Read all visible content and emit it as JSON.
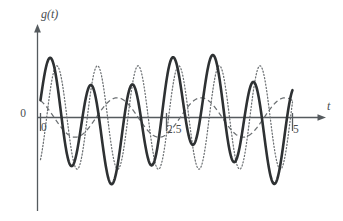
{
  "figure": {
    "background_color": "#ffffff",
    "ink_color": "#2e3133",
    "axis_color": "#555a5e",
    "secondary_color": "#6c7073"
  },
  "axes": {
    "y_axis_label": "g(t)",
    "x_axis_label": "t",
    "origin_label": "0",
    "x_tick_labels": [
      "0",
      "2.5",
      "5"
    ],
    "x_tick_values": [
      0,
      2.5,
      5
    ],
    "y_tick_labels": [],
    "has_arrow_heads": true,
    "grid": false
  },
  "chart_data": {
    "type": "line",
    "title": "",
    "subtitle": "",
    "xlabel": "t",
    "ylabel": "g(t)",
    "xlim": [
      0,
      5
    ],
    "ylim": [
      -1.45,
      1.45
    ],
    "grid": false,
    "legend": "none",
    "x_ticks": [
      0,
      2.5,
      5
    ],
    "x_tick_labels": [
      "0",
      "2.5",
      "5"
    ],
    "y_ticks": [],
    "annotations": [],
    "series": [
      {
        "name": "sum-wave",
        "style": "solid",
        "linewidth": 2.6,
        "color": "#2e3133",
        "description": "thick solid amplitude-modulated oscillation, sum of two close-frequency sinusoids",
        "formula": "sin(2*pi*1.24*t) + 0.42*cos(2*pi*0.30*t + 0.5)",
        "amplitude_max": 1.28,
        "cycles_visible": 6
      },
      {
        "name": "component-wave",
        "style": "dotted",
        "linewidth": 1.25,
        "color": "#6c7073",
        "description": "dotted sinusoid of similar frequency, phase shifted relative to the solid curve",
        "formula": "1.1*sin(2*pi*1.24*t - 0.95)",
        "amplitude_max": 1.15,
        "cycles_visible": 6
      },
      {
        "name": "envelope-wave",
        "style": "dashed",
        "linewidth": 1.25,
        "color": "#6c7073",
        "description": "slow small-amplitude dashed modulation curve",
        "formula": "0.42*cos(2*pi*0.60*t + 0.55)",
        "amplitude_max": 0.45,
        "cycles_visible": 3
      }
    ]
  }
}
